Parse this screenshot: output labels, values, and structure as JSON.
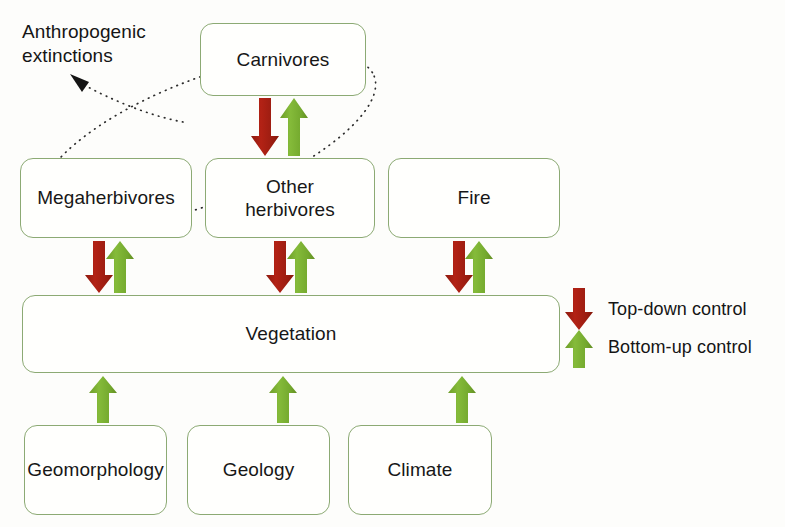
{
  "figure": {
    "background_color": "#fdfdfb",
    "box_border_color": "#8caa74",
    "text_color": "#171717",
    "top_down_color": "#a81e12",
    "bottom_up_color": "#79b032",
    "annotation_color": "#1a1a1a"
  },
  "annotations": {
    "anthropogenic_extinctions": "Anthropogenic\nextinctions"
  },
  "nodes": [
    {
      "id": "carnivores",
      "label": "Carnivores",
      "x": 200,
      "y": 23,
      "w": 166,
      "h": 73
    },
    {
      "id": "megaherbivores",
      "label": "Megaherbivores",
      "x": 20,
      "y": 158,
      "w": 172,
      "h": 80
    },
    {
      "id": "other_herbivores",
      "label": "Other\nherbivores",
      "x": 205,
      "y": 158,
      "w": 170,
      "h": 80
    },
    {
      "id": "fire",
      "label": "Fire",
      "x": 388,
      "y": 158,
      "w": 172,
      "h": 80
    },
    {
      "id": "vegetation",
      "label": "Vegetation",
      "x": 22,
      "y": 295,
      "w": 538,
      "h": 78
    },
    {
      "id": "geomorphology",
      "label": "Geomorphology",
      "x": 24,
      "y": 425,
      "w": 143,
      "h": 90
    },
    {
      "id": "geology",
      "label": "Geology",
      "x": 187,
      "y": 425,
      "w": 143,
      "h": 90
    },
    {
      "id": "climate",
      "label": "Climate",
      "x": 348,
      "y": 425,
      "w": 144,
      "h": 90
    }
  ],
  "arrows": {
    "top_down": [
      {
        "id": "carnivores-to-other-herbivores",
        "from": "carnivores",
        "to": "other_herbivores",
        "x": 265,
        "y_top": 98,
        "y_bottom": 156
      },
      {
        "id": "megaherbivores-to-vegetation",
        "from": "megaherbivores",
        "to": "vegetation",
        "x": 99,
        "y_top": 241,
        "y_bottom": 293
      },
      {
        "id": "other-herbivores-to-vegetation",
        "from": "other_herbivores",
        "to": "vegetation",
        "x": 280,
        "y_top": 241,
        "y_bottom": 293
      },
      {
        "id": "fire-to-vegetation",
        "from": "fire",
        "to": "vegetation",
        "x": 459,
        "y_top": 241,
        "y_bottom": 293
      }
    ],
    "bottom_up": [
      {
        "id": "other-herbivores-to-carnivores",
        "from": "other_herbivores",
        "to": "carnivores",
        "x": 294,
        "y_top": 98,
        "y_bottom": 156
      },
      {
        "id": "vegetation-to-megaherbivores",
        "from": "vegetation",
        "to": "megaherbivores",
        "x": 120,
        "y_top": 241,
        "y_bottom": 293
      },
      {
        "id": "vegetation-to-other-herbivores",
        "from": "vegetation",
        "to": "other_herbivores",
        "x": 301,
        "y_top": 241,
        "y_bottom": 293
      },
      {
        "id": "vegetation-to-fire",
        "from": "vegetation",
        "to": "fire",
        "x": 479,
        "y_top": 241,
        "y_bottom": 293
      },
      {
        "id": "geomorphology-to-vegetation",
        "from": "geomorphology",
        "to": "vegetation",
        "x": 103,
        "y_top": 376,
        "y_bottom": 423
      },
      {
        "id": "geology-to-vegetation",
        "from": "geology",
        "to": "vegetation",
        "x": 283,
        "y_top": 376,
        "y_bottom": 423
      },
      {
        "id": "climate-to-vegetation",
        "from": "climate",
        "to": "vegetation",
        "x": 462,
        "y_top": 376,
        "y_bottom": 423
      }
    ]
  },
  "legend": {
    "items": [
      {
        "id": "top-down",
        "icon": "down-arrow-icon",
        "label": "Top-down control",
        "color": "#a81e12"
      },
      {
        "id": "bottom-up",
        "icon": "up-arrow-icon",
        "label": "Bottom-up control",
        "color": "#79b032"
      }
    ],
    "x": 578,
    "top_down_label_x": 608,
    "top_down_label_y": 303,
    "bottom_up_label_x": 608,
    "bottom_up_label_y": 341
  }
}
